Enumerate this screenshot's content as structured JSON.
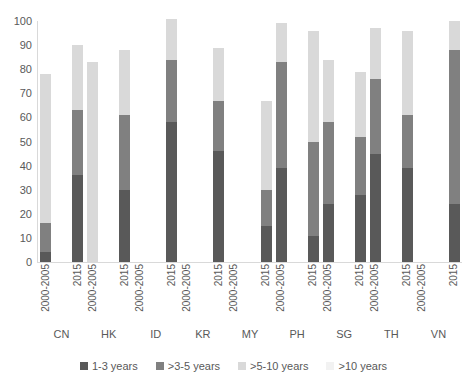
{
  "chart_data": {
    "type": "bar",
    "subtype": "stacked-bar",
    "title": "",
    "xlabel": "",
    "ylabel": "",
    "ylim": [
      0,
      100
    ],
    "yticks": [
      0,
      10,
      20,
      30,
      40,
      50,
      60,
      70,
      80,
      90,
      100
    ],
    "ytick_labels": [
      "0",
      "10",
      "20",
      "30",
      "40",
      "50",
      "60",
      "70",
      "80",
      "90",
      "100"
    ],
    "grid": false,
    "legend_position": "bottom",
    "groups": [
      "CN",
      "HK",
      "ID",
      "KR",
      "MY",
      "PH",
      "SG",
      "TH",
      "VN"
    ],
    "periods": [
      "2000-2005",
      "2015"
    ],
    "categories": [
      "CN 2000-2005",
      "CN 2015",
      "HK 2000-2005",
      "HK 2015",
      "ID 2000-2005",
      "ID 2015",
      "KR 2000-2005",
      "KR 2015",
      "MY 2000-2005",
      "MY 2015",
      "PH 2000-2005",
      "PH 2015",
      "SG 2000-2005",
      "SG 2015",
      "TH 2000-2005",
      "TH 2015",
      "VN 2000-2005",
      "VN 2015"
    ],
    "series": [
      {
        "name": "1-3 years",
        "color": "#595959",
        "values": [
          4,
          36,
          0,
          30,
          0,
          58,
          0,
          46,
          0,
          15,
          39,
          11,
          24,
          28,
          45,
          39,
          0,
          24
        ]
      },
      {
        "name": ">3-5 years",
        "color": "#808080",
        "values": [
          12,
          27,
          0,
          31,
          0,
          26,
          0,
          21,
          0,
          15,
          44,
          39,
          34,
          24,
          31,
          22,
          0,
          64
        ]
      },
      {
        "name": ">5-10 years",
        "color": "#d9d9d9",
        "values": [
          62,
          27,
          83,
          27,
          0,
          17,
          0,
          22,
          0,
          37,
          16,
          46,
          26,
          27,
          21,
          35,
          0,
          12
        ]
      },
      {
        "name": ">10 years",
        "color": "#f2f2f2",
        "values": [
          0,
          0,
          0,
          0,
          0,
          0,
          0,
          0,
          0,
          0,
          0,
          0,
          0,
          0,
          0,
          0,
          0,
          0
        ]
      }
    ],
    "totals": [
      78,
      90,
      83,
      88,
      0,
      101,
      0,
      89,
      0,
      67,
      99,
      96,
      84,
      79,
      97,
      96,
      0,
      100
    ]
  },
  "legend": {
    "items": [
      {
        "label": "1-3 years",
        "color": "#595959"
      },
      {
        "label": ">3-5 years",
        "color": "#808080"
      },
      {
        "label": ">5-10 years",
        "color": "#d9d9d9"
      },
      {
        "label": ">10 years",
        "color": "#f2f2f2"
      }
    ]
  },
  "axis": {
    "y_ticks": [
      "100",
      "90",
      "80",
      "70",
      "60",
      "50",
      "40",
      "30",
      "20",
      "10",
      "0"
    ],
    "x_tick_labels": [
      "2000-2005",
      "2015",
      "2000-2005",
      "2015",
      "2000-2005",
      "2015",
      "2000-2005",
      "2015",
      "2000-2005",
      "2015",
      "2000-2005",
      "2015",
      "2000-2005",
      "2015",
      "2000-2005",
      "2015",
      "2000-2005",
      "2015"
    ],
    "group_labels": [
      "CN",
      "HK",
      "ID",
      "KR",
      "MY",
      "PH",
      "SG",
      "TH",
      "VN"
    ]
  }
}
